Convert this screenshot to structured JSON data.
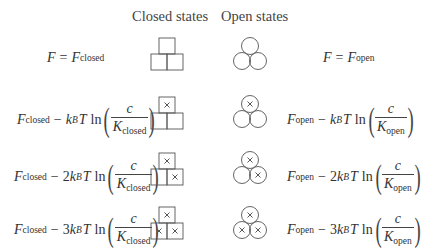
{
  "headers": {
    "closed": "Closed states",
    "open": "Open states"
  },
  "rows": [
    {
      "ligands_bound": 0,
      "closed_formula": {
        "lhs": "F",
        "eq": "=",
        "base": "F",
        "base_sub": "closed"
      },
      "open_formula": {
        "lhs": "F",
        "eq": "=",
        "base": "F",
        "base_sub": "open"
      }
    },
    {
      "ligands_bound": 1,
      "closed_formula": {
        "base": "F",
        "base_sub": "closed",
        "minus": "−",
        "coef": "",
        "k": "k",
        "k_sub": "B",
        "T": "T",
        "ln": "ln",
        "num": "c",
        "den": "K",
        "den_sub": "closed"
      },
      "open_formula": {
        "base": "F",
        "base_sub": "open",
        "minus": "−",
        "coef": "",
        "k": "k",
        "k_sub": "B",
        "T": "T",
        "ln": "ln",
        "num": "c",
        "den": "K",
        "den_sub": "open"
      }
    },
    {
      "ligands_bound": 2,
      "closed_formula": {
        "base": "F",
        "base_sub": "closed",
        "minus": "−",
        "coef": "2",
        "k": "k",
        "k_sub": "B",
        "T": "T",
        "ln": "ln",
        "num": "c",
        "den": "K",
        "den_sub": "closed"
      },
      "open_formula": {
        "base": "F",
        "base_sub": "open",
        "minus": "−",
        "coef": "2",
        "k": "k",
        "k_sub": "B",
        "T": "T",
        "ln": "ln",
        "num": "c",
        "den": "K",
        "den_sub": "open"
      }
    },
    {
      "ligands_bound": 3,
      "closed_formula": {
        "base": "F",
        "base_sub": "closed",
        "minus": "−",
        "coef": "3",
        "k": "k",
        "k_sub": "B",
        "T": "T",
        "ln": "ln",
        "num": "c",
        "den": "K",
        "den_sub": "closed"
      },
      "open_formula": {
        "base": "F",
        "base_sub": "open",
        "minus": "−",
        "coef": "3",
        "k": "k",
        "k_sub": "B",
        "T": "T",
        "ln": "ln",
        "num": "c",
        "den": "K",
        "den_sub": "open"
      }
    }
  ],
  "symbols": {
    "bound_marker": "×",
    "lparen": "(",
    "rparen": ")"
  },
  "colors": {
    "stroke": "#555555",
    "text": "#333333"
  }
}
